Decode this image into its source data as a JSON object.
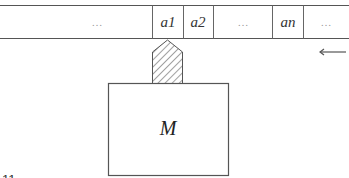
{
  "diagram": {
    "type": "turing-machine",
    "tape": {
      "cells": [
        {
          "label": "…",
          "kind": "ellipsis"
        },
        {
          "label": "a1",
          "kind": "symbol"
        },
        {
          "label": "a2",
          "kind": "symbol"
        },
        {
          "label": "…",
          "kind": "ellipsis"
        },
        {
          "label": "an",
          "kind": "symbol"
        },
        {
          "label": "…",
          "kind": "ellipsis"
        }
      ],
      "direction_arrow": "left-arrow"
    },
    "head": {
      "style": "hatched-pentagon",
      "position_cell": 1
    },
    "machine": {
      "label": "M"
    },
    "figure_number_fragment": "11"
  }
}
